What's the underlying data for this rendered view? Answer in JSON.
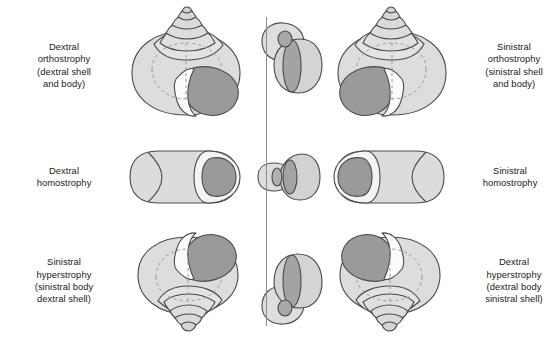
{
  "figure": {
    "background_color": "#ffffff",
    "text_color": "#1a1a1a",
    "axis": {
      "name": "coiling-axis",
      "color": "#8d8d8d",
      "orientation": "vertical"
    },
    "palette": {
      "shell_light": "#e2e2e2",
      "shell_mid": "#d0d0d0",
      "shell_shade": "#c2c2c2",
      "aperture_dark": "#9a9a9a",
      "aperture_darker": "#8e8e8e",
      "lip_white": "#fbfbfb",
      "outline": "#4a4a4a",
      "dashed_line": "#9b9b9b"
    }
  },
  "rows": [
    {
      "id": "orthostrophy",
      "left_label": {
        "lines": [
          "Dextral",
          "orthostrophy",
          "(dextral shell",
          "and body)"
        ]
      },
      "right_label": {
        "lines": [
          "Sinistral",
          "orthostrophy",
          "(sinistral shell",
          "and body)"
        ]
      },
      "left_shell": "dextral-orthostrophic-shell",
      "center_figure": "orthostrophic-whorl-axis-section",
      "right_shell": "sinistral-orthostrophic-shell"
    },
    {
      "id": "homostrophy",
      "left_label": {
        "lines": [
          "Dextral",
          "homostrophy"
        ]
      },
      "right_label": {
        "lines": [
          "Sinistral",
          "homostrophy"
        ]
      },
      "left_shell": "dextral-homostrophic-shell",
      "center_figure": "homostrophic-whorl-axis-section",
      "right_shell": "sinistral-homostrophic-shell"
    },
    {
      "id": "hyperstrophy",
      "left_label": {
        "lines": [
          "Sinistral",
          "hyperstrophy",
          "(sinistral body",
          "dextral shell)"
        ]
      },
      "right_label": {
        "lines": [
          "Dextral",
          "hyperstrophy",
          "(dextral body",
          "sinistral shell)"
        ]
      },
      "left_shell": "sinistral-hyperstrophic-shell",
      "center_figure": "hyperstrophic-whorl-axis-section",
      "right_shell": "dextral-hyperstrophic-shell"
    }
  ]
}
